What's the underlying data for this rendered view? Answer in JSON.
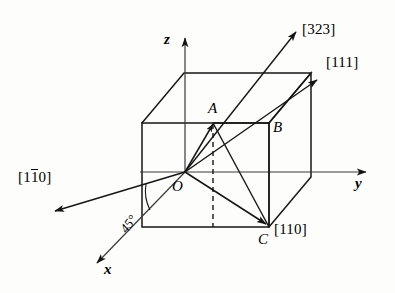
{
  "figure": {
    "kind": "crystallographic-direction-diagram",
    "background_color": "#fdfdfc",
    "line_color": "#1a1a1a"
  },
  "axes": [
    {
      "name": "z-axis",
      "label": "z",
      "direction": "up"
    },
    {
      "name": "y-axis",
      "label": "y",
      "direction": "right"
    },
    {
      "name": "x-axis",
      "label": "x",
      "direction": "down-left"
    }
  ],
  "points": [
    {
      "name": "O",
      "label": "O",
      "role": "origin"
    },
    {
      "name": "A",
      "label": "A",
      "role": "top-face-point"
    },
    {
      "name": "B",
      "label": "B",
      "role": "right-face-corner"
    },
    {
      "name": "C",
      "label": "C",
      "role": "bottom-front-right-corner"
    }
  ],
  "directions": [
    {
      "name": "dir-323",
      "label": "[323]",
      "bracket_open": "[",
      "indices": "323",
      "bracket_close": "]",
      "overbar_index": null
    },
    {
      "name": "dir-111",
      "label": "[111]",
      "bracket_open": "[",
      "indices": "111",
      "bracket_close": "]",
      "overbar_index": null
    },
    {
      "name": "dir-110",
      "label": "[110]",
      "bracket_open": "[",
      "indices": "110",
      "bracket_close": "]",
      "overbar_index": null
    },
    {
      "name": "dir-1bar10",
      "label": "[110]",
      "bracket_open": "[",
      "digit_first": "1",
      "digit_barred": "1",
      "digit_last": "0",
      "bracket_close": "]",
      "overbar_index": 1
    }
  ],
  "annotations": [
    {
      "name": "angle-45",
      "label": "45°",
      "value": 45,
      "unit": "degrees"
    }
  ]
}
